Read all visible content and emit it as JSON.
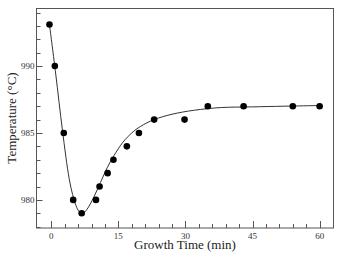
{
  "chart_data": {
    "type": "scatter",
    "title": "",
    "xlabel": "Growth Time (min)",
    "ylabel": "Temperature (°C)",
    "xlim": [
      -3.3,
      63.1
    ],
    "ylim": [
      977.9,
      994.3
    ],
    "xticks": [
      0,
      15,
      30,
      45,
      60
    ],
    "xtick_labels": [
      "0",
      "15",
      "30",
      "45",
      "60"
    ],
    "x_minor_step": 3,
    "yticks": [
      980,
      985,
      990
    ],
    "ytick_labels": [
      "980",
      "985",
      "990"
    ],
    "y_minor_step": 1,
    "grid": false,
    "legend": null,
    "series": [
      {
        "name": "measured",
        "style": "markers",
        "x": [
          -0.4,
          0.8,
          2.8,
          4.9,
          6.8,
          10.0,
          10.8,
          12.6,
          13.9,
          16.9,
          19.6,
          23.0,
          29.8,
          35.0,
          43.0,
          54.0,
          60.0
        ],
        "y": [
          993.1,
          990.0,
          985.0,
          980.0,
          979.0,
          980.0,
          981.0,
          982.0,
          983.0,
          984.0,
          985.0,
          986.0,
          986.0,
          987.0,
          987.0,
          987.0,
          987.0
        ]
      },
      {
        "name": "fit",
        "style": "line",
        "x": [
          -0.4,
          1,
          2.5,
          4,
          5.5,
          6.8,
          8,
          9.5,
          11,
          12.5,
          14,
          16,
          18,
          20,
          23,
          27,
          32,
          38,
          45,
          52,
          60
        ],
        "y": [
          993.1,
          989.4,
          985.2,
          981.6,
          979.6,
          979.0,
          979.3,
          980.2,
          981.3,
          982.4,
          983.3,
          984.3,
          985.0,
          985.5,
          986.0,
          986.4,
          986.7,
          986.9,
          986.95,
          987.0,
          987.05
        ]
      }
    ]
  }
}
